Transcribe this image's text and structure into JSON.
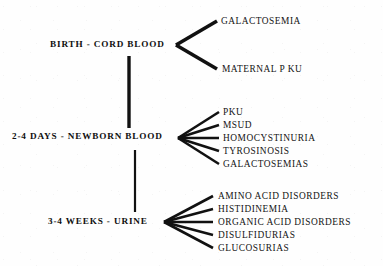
{
  "diagram": {
    "background_color": "#fefefe",
    "ink_color": "#101010",
    "stages": [
      {
        "id": "birth-cord-blood",
        "label": "BIRTH - CORD BLOOD",
        "leaves": [
          "GALACTOSEMIA",
          "MATERNAL P KU"
        ]
      },
      {
        "id": "newborn-blood",
        "label": "2-4 DAYS - NEWBORN BLOOD",
        "leaves": [
          "PKU",
          "MSUD",
          "HOMOCYSTINURIA",
          "TYROSINOSIS",
          "GALACTOSEMIAS"
        ]
      },
      {
        "id": "urine",
        "label": "3-4 WEEKS - URINE",
        "leaves": [
          "AMINO ACID DISORDERS",
          "HISTIDINEMIA",
          "ORGANIC ACID DISORDERS",
          "DISULFIDURIAS",
          "GLUCOSURIAS"
        ]
      }
    ]
  }
}
